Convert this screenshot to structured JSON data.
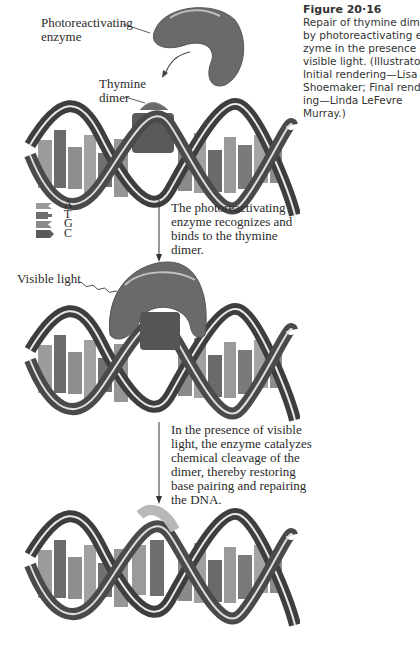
{
  "figure": {
    "number": "Figure 20·16",
    "caption_lines": [
      "Repair of thymine dim",
      "by photoreactivating e",
      "zyme in the presence o",
      "visible light. (Illustrato",
      "Initial rendering—Lisa",
      "Shoemaker; Final rend",
      "ing—Linda LeFevre",
      "Murray.)"
    ]
  },
  "labels": {
    "enzyme_line1": "Photoreactivating",
    "enzyme_line2": "enzyme",
    "dimer_line1": "Thymine",
    "dimer_line2": "dimer",
    "visible_light": "Visible light"
  },
  "legend": [
    {
      "base": "A",
      "color": "#9a9a9a"
    },
    {
      "base": "T",
      "color": "#6e6e6e"
    },
    {
      "base": "G",
      "color": "#8a8a8a"
    },
    {
      "base": "C",
      "color": "#5a5a5a"
    }
  ],
  "steps": [
    {
      "lines": [
        "The photoreactivating",
        "enzyme recognizes and",
        "binds to the thymine",
        "dimer."
      ]
    },
    {
      "lines": [
        "In the presence of visible",
        "light, the enzyme catalyzes",
        "chemical cleavage of the",
        "dimer, thereby restoring",
        "base pairing and repairing",
        "the DNA."
      ]
    }
  ],
  "colors": {
    "enzyme": "#6a6a6a",
    "backbone": "#4a4a4a",
    "base_light": "#9c9c9c",
    "base_dark": "#6c6c6c",
    "repaired_highlight": "#b8b8b8"
  }
}
